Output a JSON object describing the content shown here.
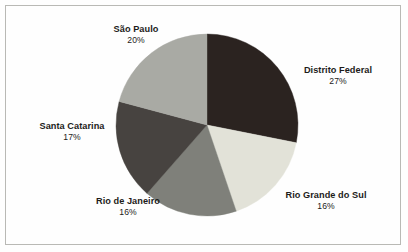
{
  "figure": {
    "background_color": "#fefefe",
    "border_color": "#b9b9b5",
    "text_color": "#1d1c1a"
  },
  "chart_data": {
    "type": "pie",
    "title": "",
    "subtitle": "",
    "xlabel": "",
    "ylabel": "",
    "grid": false,
    "legend_position": "none",
    "label_style": "outside-callout-text",
    "start_angle_deg": 0,
    "direction": "clockwise",
    "center": {
      "x": 207,
      "y": 125
    },
    "radius": 91,
    "total": 96,
    "unit": "%",
    "categories": [
      "Distrito Federal",
      "Rio Grande do Sul",
      "Rio de Janeiro",
      "Santa Catarina",
      "São Paulo"
    ],
    "values": [
      27,
      16,
      16,
      17,
      20
    ],
    "value_labels": [
      "27%",
      "16%",
      "16%",
      "17%",
      "20%"
    ],
    "colors": [
      "#2b2320",
      "#e2e2d8",
      "#7f807a",
      "#474340",
      "#a9aaa4"
    ],
    "slices": [
      {
        "label": "Distrito Federal",
        "value": 27,
        "value_label": "27%",
        "color": "#2b2320",
        "start_deg": 0,
        "end_deg": 101.25
      },
      {
        "label": "Rio Grande do Sul",
        "value": 16,
        "value_label": "16%",
        "color": "#e2e2d8",
        "start_deg": 101.25,
        "end_deg": 161.25
      },
      {
        "label": "Rio de Janeiro",
        "value": 16,
        "value_label": "16%",
        "color": "#7f807a",
        "start_deg": 161.25,
        "end_deg": 221.25
      },
      {
        "label": "Santa Catarina",
        "value": 17,
        "value_label": "17%",
        "color": "#474340",
        "start_deg": 221.25,
        "end_deg": 285.0
      },
      {
        "label": "São Paulo",
        "value": 20,
        "value_label": "20%",
        "color": "#a9aaa4",
        "start_deg": 285.0,
        "end_deg": 360.0
      }
    ]
  },
  "labels": {
    "sao_paulo": {
      "name": "São Paulo",
      "pct": "20%"
    },
    "distrito_federal": {
      "name": "Distrito Federal",
      "pct": "27%"
    },
    "santa_catarina": {
      "name": "Santa Catarina",
      "pct": "17%"
    },
    "rio_de_janeiro": {
      "name": "Rio de Janeiro",
      "pct": "16%"
    },
    "rio_grande_do_sul": {
      "name": "Rio Grande do Sul",
      "pct": "16%"
    }
  }
}
